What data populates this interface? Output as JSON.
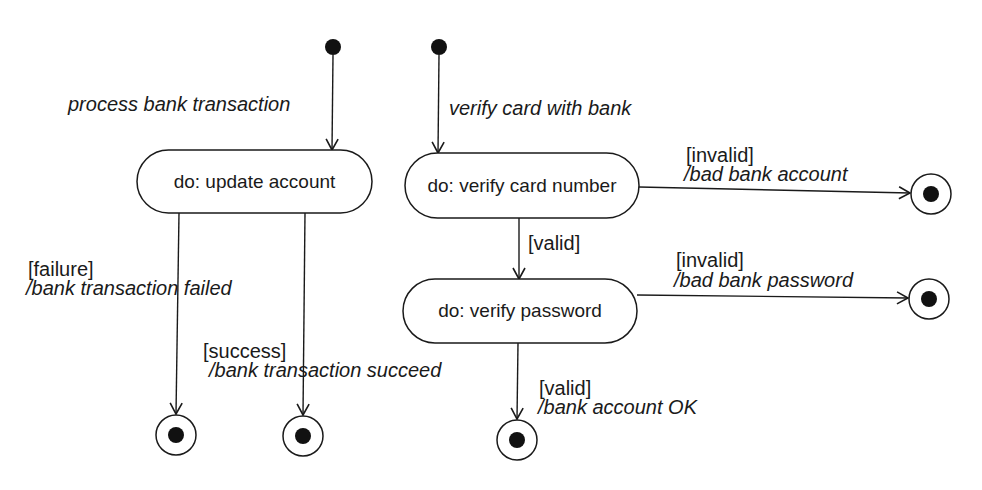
{
  "diagram": {
    "type": "UML state machine",
    "colors": {
      "line": "#1a1a1a",
      "fill": "#ffffff",
      "dot": "#111111"
    },
    "left_machine": {
      "initial_transition": {
        "event": "process bank transaction"
      },
      "state": {
        "label": "do: update account"
      },
      "transitions": [
        {
          "guard": "[failure]",
          "action": "/bank transaction failed"
        },
        {
          "guard": "[success]",
          "action": "/bank transaction succeed"
        }
      ]
    },
    "right_machine": {
      "initial_transition": {
        "event": "verify card with bank"
      },
      "states": [
        {
          "label": "do: verify card number"
        },
        {
          "label": "do: verify password"
        }
      ],
      "transitions": [
        {
          "guard": "[invalid]",
          "action": "/bad bank account"
        },
        {
          "guard": "[valid]",
          "action": ""
        },
        {
          "guard": "[invalid]",
          "action": "/bad bank password"
        },
        {
          "guard": "[valid]",
          "action": "/bank account OK"
        }
      ]
    }
  }
}
